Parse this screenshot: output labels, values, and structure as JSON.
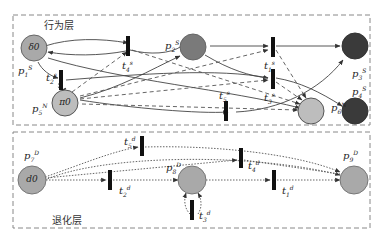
{
  "layers": {
    "behavior": {
      "title": "行为层"
    },
    "degradation": {
      "title": "退化层"
    }
  },
  "colors": {
    "gray_fill": "#a9a9a9",
    "light_fill": "#bdbdbd",
    "dark_fill": "#3a3a3a",
    "stroke": "#555555",
    "box": "#888888"
  },
  "places": {
    "delta0": {
      "text": "δ0",
      "label_base": "p",
      "label_sub": "1",
      "label_sup": "S"
    },
    "pi0": {
      "text": "π0",
      "label_base": "p",
      "label_sub": "5",
      "label_sup": "N"
    },
    "p2": {
      "label_base": "p",
      "label_sub": "2",
      "label_sup": "S"
    },
    "p6": {
      "label_base": "p",
      "label_sub": "6",
      "label_sup": "N"
    },
    "p3": {
      "label_base": "p",
      "label_sub": "3",
      "label_sup": "S"
    },
    "p4": {
      "label_base": "p",
      "label_sub": "4",
      "label_sup": "S"
    },
    "d0": {
      "text": "d0",
      "label_base": "p",
      "label_sub": "7",
      "label_sup": "D"
    },
    "p8": {
      "label_base": "p",
      "label_sub": "8",
      "label_sup": "D"
    },
    "p9": {
      "label_base": "p",
      "label_sub": "9",
      "label_sup": "D"
    }
  },
  "transitions": {
    "t1s": {
      "base": "t",
      "sub": "1",
      "sup": "s"
    },
    "t2s": {
      "base": "t",
      "sub": "2",
      "sup": "s"
    },
    "t3s": {
      "base": "t",
      "sub": "3",
      "sup": "s"
    },
    "t4s": {
      "base": "t",
      "sub": "4",
      "sup": "s"
    },
    "t5s": {
      "base": "t",
      "sub": "5",
      "sup": "s"
    },
    "t1d": {
      "base": "t",
      "sub": "1",
      "sup": "d"
    },
    "t2d": {
      "base": "t",
      "sub": "2",
      "sup": "d"
    },
    "t3d": {
      "base": "t",
      "sub": "3",
      "sup": "d"
    },
    "t4d": {
      "base": "t",
      "sub": "4",
      "sup": "d"
    },
    "t5d": {
      "base": "t",
      "sub": "5",
      "sup": "d"
    }
  }
}
